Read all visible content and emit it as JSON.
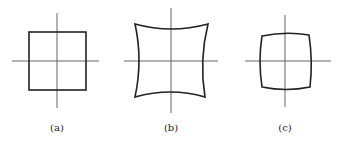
{
  "figure": {
    "panels": [
      {
        "id": "a",
        "label": "(a)",
        "description": "undistorted square grid"
      },
      {
        "id": "b",
        "label": "(b)",
        "description": "pincushion distortion"
      },
      {
        "id": "c",
        "label": "(c)",
        "description": "barrel distortion"
      }
    ]
  }
}
